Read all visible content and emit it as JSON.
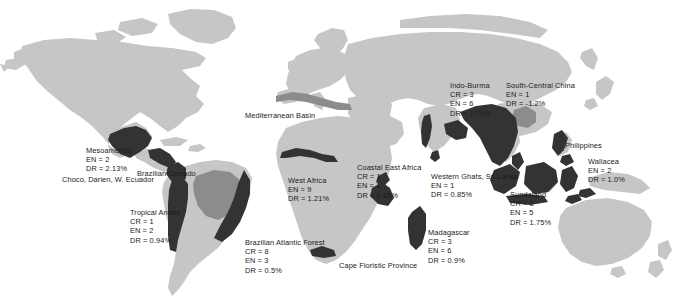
{
  "figure": {
    "type": "world-map",
    "background_color": "#ffffff",
    "land_color": "#c6c6c6",
    "hotspot_dark_color": "#333333",
    "hotspot_mid_color": "#8c8c8c",
    "text_color": "#1a1a1a",
    "width": 685,
    "height": 305
  },
  "hotspots": [
    {
      "name": "Mesoamerica",
      "stats": [
        "EN = 2",
        "DR = 2.13%"
      ],
      "x": 86,
      "y": 146
    },
    {
      "name": "Choco, Darien, W. Ecuador",
      "stats": [],
      "x": 62,
      "y": 175
    },
    {
      "name": "Brazilian Cerrado",
      "stats": [],
      "x": 137,
      "y": 169
    },
    {
      "name": "Tropical Andes",
      "stats": [
        "CR = 1",
        "EN = 2",
        "DR = 0.94%"
      ],
      "x": 130,
      "y": 208
    },
    {
      "name": "Brazilian Atlantic Forest",
      "stats": [
        "CR = 8",
        "EN = 3",
        "DR = 0.5%"
      ],
      "x": 245,
      "y": 238
    },
    {
      "name": "Mediterranean Basin",
      "stats": [],
      "x": 245,
      "y": 111
    },
    {
      "name": "West Africa",
      "stats": [
        "EN = 9",
        "DR = 1.21%"
      ],
      "x": 288,
      "y": 176
    },
    {
      "name": "Coastal East Africa",
      "stats": [
        "CR = 1",
        "EN = 1",
        "DR = 0.65%"
      ],
      "x": 357,
      "y": 163
    },
    {
      "name": "Cape Floristic Province",
      "stats": [],
      "x": 339,
      "y": 261
    },
    {
      "name": "Madagascar",
      "stats": [
        "CR = 3",
        "EN = 6",
        "DR = 0.9%"
      ],
      "x": 428,
      "y": 228
    },
    {
      "name": "Western Ghats, Sri Lanka",
      "stats": [
        "EN = 1",
        "DR = 0.85%"
      ],
      "x": 431,
      "y": 172
    },
    {
      "name": "Sundaland",
      "stats": [
        "CR = 3",
        "EN = 5",
        "DR = 1.75%"
      ],
      "x": 510,
      "y": 190
    },
    {
      "name": "Indo-Burma",
      "stats": [
        "CR = 3",
        "EN = 6",
        "DR = 1.76%"
      ],
      "x": 450,
      "y": 81
    },
    {
      "name": "South-Central China",
      "stats": [
        "EN = 1",
        "DR = -1.2%"
      ],
      "x": 506,
      "y": 81
    },
    {
      "name": "Philippines",
      "stats": [],
      "x": 565,
      "y": 141
    },
    {
      "name": "Wallacea",
      "stats": [
        "EN = 2",
        "DR = 1.0%"
      ],
      "x": 588,
      "y": 157
    }
  ]
}
